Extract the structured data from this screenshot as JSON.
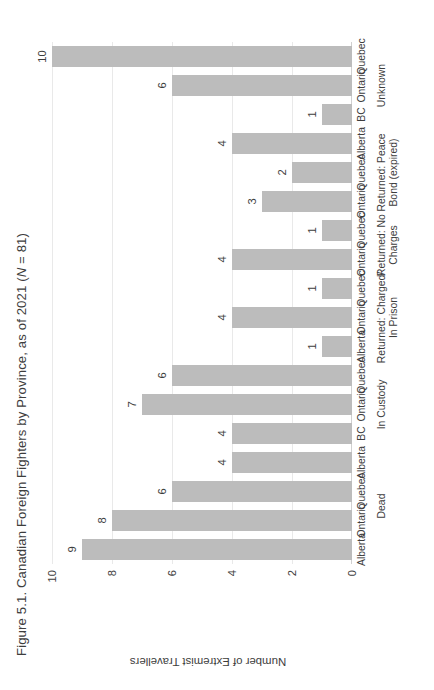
{
  "chart_data": {
    "type": "bar",
    "title": "Figure 5.1. Canadian Foreign Fighters by Province, as of 2021 (N = 81)",
    "title_parts": {
      "before_italic": "Figure 5.1. Canadian Foreign Fighters by Province, as of 2021 (",
      "italic": "N",
      "after_italic": " = 81)"
    },
    "xlabel": "",
    "ylabel": "Number of Extremist Travellers",
    "ylim": [
      0,
      10
    ],
    "yticks": [
      "0",
      "2",
      "4",
      "6",
      "8",
      "10"
    ],
    "ytick_values": [
      0,
      2,
      4,
      6,
      8,
      10
    ],
    "grid": true,
    "legend": "none",
    "orientation": "vertical",
    "bar_color": "#bcbcbc",
    "categories": [
      "Alberta",
      "Ontario",
      "Quebec",
      "Alberta",
      "BC",
      "Ontario",
      "Quebec",
      "Alberta",
      "Ontario",
      "Quebec",
      "Ontario",
      "Quebec",
      "Ontario",
      "Quebec",
      "Alberta",
      "BC",
      "Ontario",
      "Quebec"
    ],
    "values": [
      9,
      8,
      6,
      4,
      4,
      7,
      6,
      1,
      4,
      1,
      4,
      1,
      3,
      2,
      4,
      1,
      6,
      10
    ],
    "groups": [
      {
        "label": "Dead",
        "start": 0,
        "count": 4
      },
      {
        "label": "In Custody",
        "start": 4,
        "count": 3
      },
      {
        "label": "Returned: Charged/\nIn Prison",
        "start": 7,
        "count": 3
      },
      {
        "label": "Returned: No\nCharges",
        "start": 10,
        "count": 2
      },
      {
        "label": "Returned: Peace\nBond (expired)",
        "start": 12,
        "count": 3
      },
      {
        "label": "Unknown",
        "start": 15,
        "count": 3
      }
    ]
  }
}
